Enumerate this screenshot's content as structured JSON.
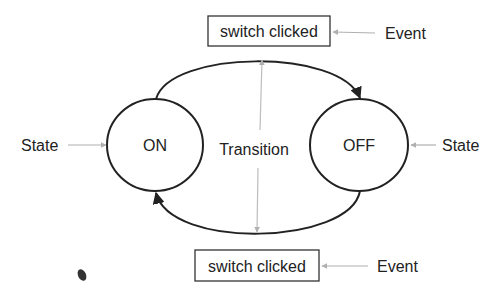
{
  "diagram": {
    "type": "state-machine",
    "states": [
      {
        "id": "on",
        "label": "ON"
      },
      {
        "id": "off",
        "label": "OFF"
      }
    ],
    "transitions": [
      {
        "from": "on",
        "to": "off",
        "event": "switch clicked"
      },
      {
        "from": "off",
        "to": "on",
        "event": "switch clicked"
      }
    ],
    "annotations": {
      "state_left": "State",
      "state_right": "State",
      "transition": "Transition",
      "event_top": "Event",
      "event_bottom": "Event"
    },
    "event_boxes": {
      "top": "switch clicked",
      "bottom": "switch clicked"
    },
    "colors": {
      "stroke": "#222222",
      "pointer": "#b0b0b0",
      "background": "#ffffff"
    }
  }
}
